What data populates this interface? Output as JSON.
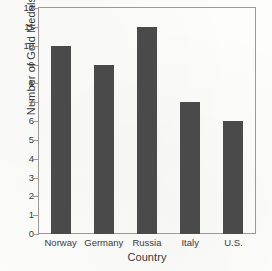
{
  "chart_data": {
    "type": "bar",
    "title": "",
    "xlabel": "Country",
    "ylabel": "Number of Gold Medals",
    "categories": [
      "Norway",
      "Germany",
      "Russia",
      "Italy",
      "U.S."
    ],
    "values": [
      10,
      9,
      11,
      7,
      6
    ],
    "ylim": [
      0,
      12
    ],
    "ytick_labels": [
      "0",
      "1",
      "2",
      "3",
      "4",
      "5",
      "6",
      "7",
      "8",
      "9",
      "10",
      "11",
      "12"
    ],
    "ytick_values": [
      0,
      1,
      2,
      3,
      4,
      5,
      6,
      7,
      8,
      9,
      10,
      11,
      12
    ],
    "grid": false,
    "legend": false,
    "legend_position": "none",
    "bar_color": "#4a4a4a",
    "axis_color": "#9a9a9a",
    "text_color": "#3a3a3a",
    "background_color": "#fdfdfc"
  }
}
